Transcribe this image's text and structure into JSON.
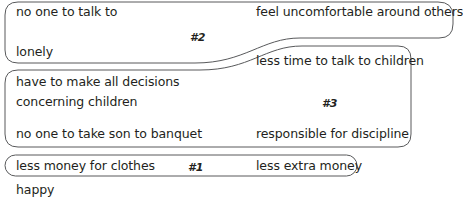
{
  "diagram": {
    "groups": [
      {
        "label": "#2",
        "items": [
          "no one to talk to",
          "lonely",
          "feel uncomfortable around others"
        ]
      },
      {
        "label": "#3",
        "items": [
          "less time to talk to children",
          "have to make all decisions",
          "concerning children",
          "no one to take son to banquet",
          "responsible for discipline"
        ]
      },
      {
        "label": "#1",
        "items": [
          "less money for clothes",
          "less extra money"
        ]
      }
    ],
    "ungrouped": [
      "happy"
    ],
    "colors": {
      "stroke": "#58595b",
      "text": "#231f20",
      "background": "#ffffff"
    }
  }
}
